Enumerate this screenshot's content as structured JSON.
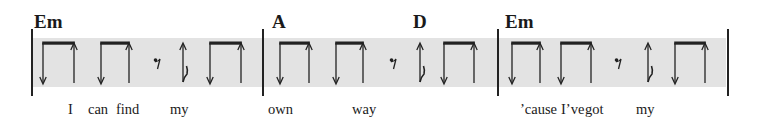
{
  "chords": [
    {
      "label": "Em",
      "x": 34
    },
    {
      "label": "A",
      "x": 272
    },
    {
      "label": "D",
      "x": 413
    },
    {
      "label": "Em",
      "x": 505
    }
  ],
  "lyrics": [
    {
      "text": "I",
      "x": 68
    },
    {
      "text": "can",
      "x": 88
    },
    {
      "text": "find",
      "x": 116
    },
    {
      "text": "my",
      "x": 170
    },
    {
      "text": "own",
      "x": 268
    },
    {
      "text": "way",
      "x": 352
    },
    {
      "text": "’cause",
      "x": 520
    },
    {
      "text": "I’ve",
      "x": 561
    },
    {
      "text": "got",
      "x": 585
    },
    {
      "text": "my",
      "x": 636
    }
  ],
  "barlines": [
    31,
    262,
    497,
    727
  ],
  "band_color": "#e3e3e3",
  "strum_pattern": [
    "down-up",
    "down-up",
    "eighth-rest",
    "up-with-flag",
    "down-up"
  ],
  "measures": [
    {
      "pairs": [
        [
          43,
          74
        ],
        [
          101,
          129
        ],
        [
          210,
          241
        ]
      ],
      "rest_x": 157,
      "flag_x": 183
    },
    {
      "pairs": [
        [
          280,
          309
        ],
        [
          336,
          363
        ],
        [
          444,
          474
        ]
      ],
      "rest_x": 393,
      "flag_x": 420
    },
    {
      "pairs": [
        [
          512,
          540
        ],
        [
          561,
          591
        ],
        [
          675,
          705
        ]
      ],
      "rest_x": 618,
      "flag_x": 648
    }
  ]
}
